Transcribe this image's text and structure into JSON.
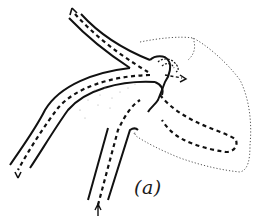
{
  "figure": {
    "label": "(a)",
    "colors": {
      "vessel_wall": "#111111",
      "flow_path": "#111111",
      "outline_dotted": "#555555",
      "background": "#ffffff"
    },
    "icons": {
      "arrow_up_left": "arrowhead-up-left",
      "arrow_down_left": "arrowhead-down-left",
      "arrow_up_bottom": "arrowhead-up",
      "arrow_right_junction": "arrowhead-right"
    }
  }
}
